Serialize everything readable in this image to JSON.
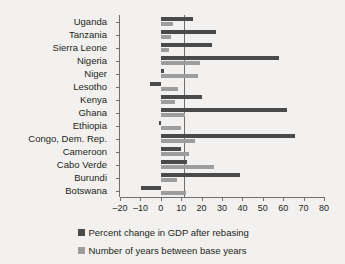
{
  "chart_data": {
    "type": "bar",
    "orientation": "horizontal",
    "title": "",
    "xlabel": "",
    "ylabel": "",
    "xlim": [
      -20,
      80
    ],
    "xticks": [
      -20,
      -10,
      0,
      10,
      20,
      30,
      40,
      50,
      60,
      70,
      80
    ],
    "xtick_labels": [
      "–20",
      "–10",
      "0",
      "10",
      "20",
      "30",
      "40",
      "50",
      "60",
      "70",
      "80"
    ],
    "grid": false,
    "legend_position": "bottom",
    "categories": [
      "Uganda",
      "Tanzania",
      "Sierra Leone",
      "Nigeria",
      "Niger",
      "Lesotho",
      "Kenya",
      "Ghana",
      "Ethiopia",
      "Congo, Dem. Rep.",
      "Cameroon",
      "Cabo Verde",
      "Burundi",
      "Botswana"
    ],
    "series": [
      {
        "name": "Percent change in GDP after rebasing",
        "color": "#4a4a4a",
        "values": [
          16,
          27,
          25,
          58,
          1.5,
          -5.5,
          20,
          62,
          -1,
          66,
          10,
          13,
          39,
          -9.5
        ]
      },
      {
        "name": "Number of years between base years",
        "color": "#9d9d9d",
        "values": [
          6,
          5,
          4,
          19,
          18,
          8.5,
          7,
          12,
          10,
          17,
          14,
          26,
          8,
          12.5
        ]
      }
    ]
  },
  "legend": {
    "items": [
      {
        "label": "Percent change in GDP after rebasing",
        "color": "#4a4a4a"
      },
      {
        "label": "Number of years between base years",
        "color": "#9d9d9d"
      }
    ]
  }
}
